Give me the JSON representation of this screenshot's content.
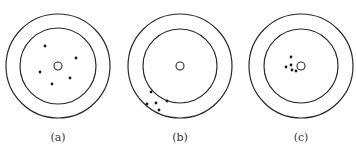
{
  "diagram": {
    "type": "target-shot-patterns",
    "colors": {
      "stroke": "#2a2a2a",
      "dot": "#1a1a1a",
      "label": "#333333"
    },
    "panels": [
      {
        "label": "(a)",
        "center": [
          58,
          66
        ],
        "outer_radius": 52,
        "inner_radius": 38,
        "bullseye_radius": 4,
        "dots": [
          [
            45,
            46
          ],
          [
            76,
            58
          ],
          [
            40,
            72
          ],
          [
            70,
            78
          ],
          [
            52,
            84
          ]
        ]
      },
      {
        "label": "(b)",
        "center": [
          180,
          66
        ],
        "outer_radius": 52,
        "inner_radius": 37,
        "bullseye_radius": 4,
        "dots": [
          [
            151,
            92
          ],
          [
            147,
            104
          ],
          [
            156,
            103
          ],
          [
            167,
            101
          ],
          [
            159,
            110
          ]
        ]
      },
      {
        "label": "(c)",
        "center": [
          301,
          66
        ],
        "outer_radius": 52,
        "inner_radius": 37,
        "bullseye_radius": 4,
        "dots": [
          [
            291,
            57
          ],
          [
            286,
            67
          ],
          [
            291,
            65
          ],
          [
            296,
            71
          ],
          [
            292,
            70
          ]
        ]
      }
    ]
  }
}
